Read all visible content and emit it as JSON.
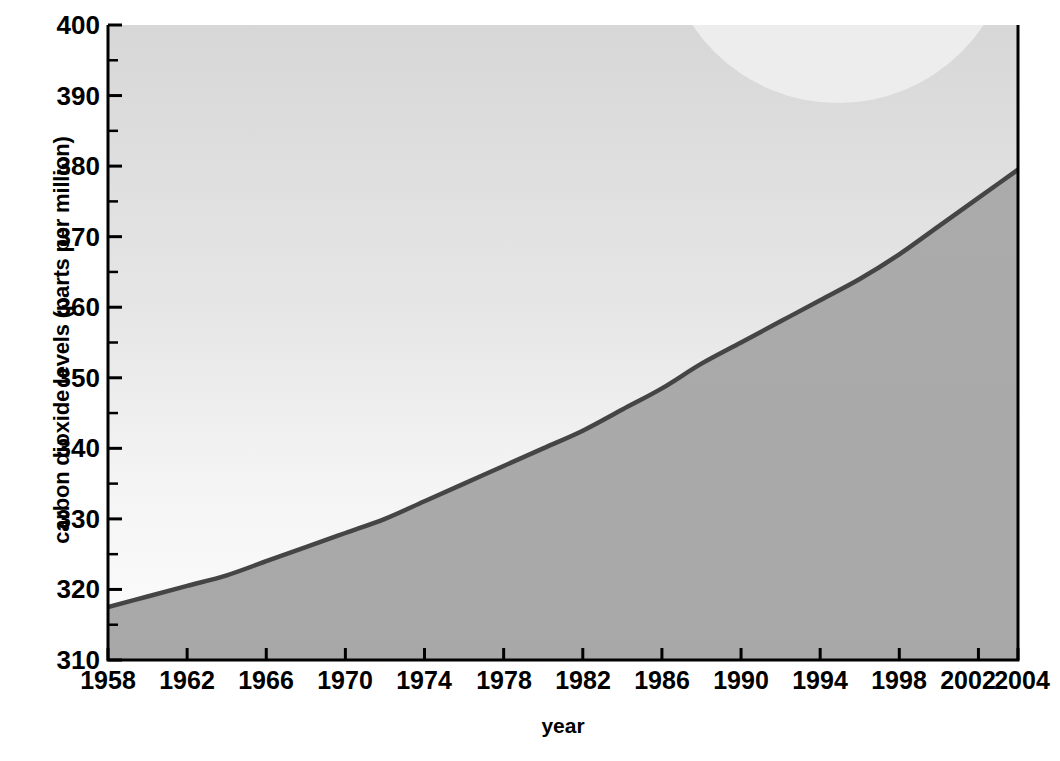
{
  "chart_data": {
    "type": "area",
    "title": "",
    "xlabel": "year",
    "ylabel": "carbon dioxide levels (parts per million)",
    "xlim": [
      1958,
      2004
    ],
    "ylim": [
      310,
      400
    ],
    "grid": false,
    "legend": null,
    "y_tick_labels": [
      "400",
      "390",
      "380",
      "370",
      "360",
      "350",
      "340",
      "330",
      "320",
      "310"
    ],
    "y_ticks": [
      400,
      390,
      380,
      370,
      360,
      350,
      340,
      330,
      320,
      310
    ],
    "y_minor_ticks": [
      395,
      385,
      375,
      365,
      355,
      345,
      335,
      325,
      315
    ],
    "x_tick_labels": [
      "1958",
      "1962",
      "1966",
      "1970",
      "1974",
      "1978",
      "1982",
      "1986",
      "1990",
      "1994",
      "1998",
      "2002",
      "2004"
    ],
    "x_ticks": [
      1958,
      1962,
      1966,
      1970,
      1974,
      1978,
      1982,
      1986,
      1990,
      1994,
      1998,
      2002,
      2004
    ],
    "series": [
      {
        "name": "carbon dioxide concentration",
        "x": [
          1958,
          1960,
          1962,
          1964,
          1966,
          1968,
          1970,
          1972,
          1974,
          1976,
          1978,
          1980,
          1982,
          1984,
          1986,
          1988,
          1990,
          1992,
          1994,
          1996,
          1998,
          2000,
          2002,
          2004,
          2006
        ],
        "values": [
          317.5,
          319.0,
          320.5,
          322.0,
          324.0,
          326.0,
          328.0,
          330.0,
          332.5,
          335.0,
          337.5,
          340.0,
          342.5,
          345.5,
          348.5,
          352.0,
          355.0,
          358.0,
          361.0,
          364.0,
          367.5,
          371.5,
          375.5,
          379.5,
          383.5
        ]
      }
    ],
    "colors": {
      "line": "#454545",
      "area_below": "#a9a9a9",
      "area_above_top": "#d8d8d8",
      "area_above_bottom": "#fbfbfb",
      "axis": "#000000",
      "overlay_circle": "#ededed",
      "text": "#000000"
    }
  },
  "annotations": {
    "overlay_circle_name": "decorative-circle"
  }
}
